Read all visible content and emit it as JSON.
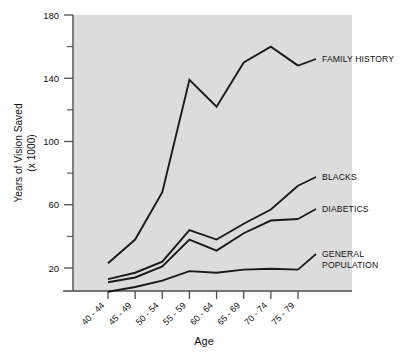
{
  "chart_data": {
    "type": "line",
    "title": "",
    "xlabel": "Age",
    "ylabel": "Years of Vision Saved (x 1000)",
    "ylabel_line1": "Years of Vision Saved",
    "ylabel_line2": "(x 1000)",
    "categories": [
      "40 - 44",
      "45 - 49",
      "50 - 54",
      "55 - 59",
      "60 - 64",
      "65 - 69",
      "70 - 74",
      "75 - 79"
    ],
    "ylim": [
      0,
      180
    ],
    "yticks": [
      20,
      60,
      100,
      140,
      180
    ],
    "yticks_minor": [
      40,
      80,
      120,
      160
    ],
    "grid": false,
    "legend_position": "right-inline",
    "series": [
      {
        "name": "FAMILY HISTORY",
        "label_line1": "FAMILY HISTORY",
        "label_line2": "",
        "values": [
          23,
          38,
          68,
          139,
          122,
          150,
          160,
          148
        ],
        "color": "#1a1a1a"
      },
      {
        "name": "BLACKS",
        "label_line1": "BLACKS",
        "label_line2": "",
        "values": [
          13,
          17,
          24,
          44,
          38,
          48,
          57,
          72
        ],
        "color": "#1a1a1a"
      },
      {
        "name": "DIABETICS",
        "label_line1": "DIABETICS",
        "label_line2": "",
        "values": [
          11,
          14,
          21,
          38,
          31,
          42,
          50,
          51
        ],
        "color": "#1a1a1a"
      },
      {
        "name": "GENERAL POPULATION",
        "label_line1": "GENERAL",
        "label_line2": "POPULATION",
        "values": [
          5,
          8,
          12,
          18,
          17,
          19,
          19.5,
          19
        ],
        "color": "#1a1a1a"
      }
    ],
    "plot_background": "#dcdcdc",
    "axis_color": "#4d4d4d",
    "line_color": "#1a1a1a"
  }
}
